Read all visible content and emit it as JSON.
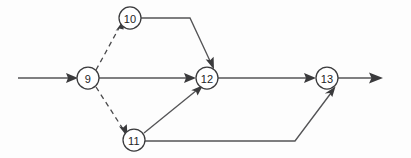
{
  "diagram": {
    "type": "directed-network",
    "canvas": {
      "width": 411,
      "height": 158,
      "background": "#fdfdfd"
    },
    "colors": {
      "node_stroke": "#3b3b3d",
      "node_fill": "#ffffff",
      "edge_solid": "#545456",
      "edge_dashed": "#4a4a4c",
      "label": "#242426"
    },
    "nodes": [
      {
        "id": "n9",
        "label": "9",
        "cx": 88,
        "cy": 78,
        "r": 11
      },
      {
        "id": "n10",
        "label": "10",
        "cx": 130,
        "cy": 18,
        "r": 11
      },
      {
        "id": "n11",
        "label": "11",
        "cx": 134,
        "cy": 140,
        "r": 11
      },
      {
        "id": "n12",
        "label": "12",
        "cx": 207,
        "cy": 78,
        "r": 11
      },
      {
        "id": "n13",
        "label": "13",
        "cx": 327,
        "cy": 78,
        "r": 11
      }
    ],
    "edges": [
      {
        "id": "e-entry",
        "from": "start",
        "to": "n9",
        "style": "solid",
        "arrow": true
      },
      {
        "id": "e-9-10",
        "from": "n9",
        "to": "n10",
        "style": "dashed",
        "arrow": true
      },
      {
        "id": "e-9-11",
        "from": "n9",
        "to": "n11",
        "style": "dashed",
        "arrow": true
      },
      {
        "id": "e-9-12",
        "from": "n9",
        "to": "n12",
        "style": "solid",
        "arrow": true
      },
      {
        "id": "e-10-12",
        "from": "n10",
        "to": "n12",
        "style": "solid",
        "arrow": true
      },
      {
        "id": "e-11-12",
        "from": "n11",
        "to": "n12",
        "style": "solid",
        "arrow": true
      },
      {
        "id": "e-11-13",
        "from": "n11",
        "to": "n13",
        "style": "solid",
        "arrow": true
      },
      {
        "id": "e-12-13",
        "from": "n12",
        "to": "n13",
        "style": "solid",
        "arrow": true
      },
      {
        "id": "e-exit",
        "from": "n13",
        "to": "end",
        "style": "solid",
        "arrow": true
      }
    ],
    "paths": {
      "entry": "M 18,78 L 73,78",
      "e9_10": "M 97,70 L 120.5,27",
      "e9_11": "M 97,87 L 125.5,130",
      "e9_12": "M 99,78 L 194,78",
      "e10_12": "M 141,18 L 190,18 L 213,66",
      "e11_12": "M 144,133 L 199.5,88",
      "e11_13": "M 145,141 L 295,141 L 334,89",
      "e12_13": "M 218,78 L 314,78",
      "exit": "M 338,78 L 381,78"
    }
  }
}
